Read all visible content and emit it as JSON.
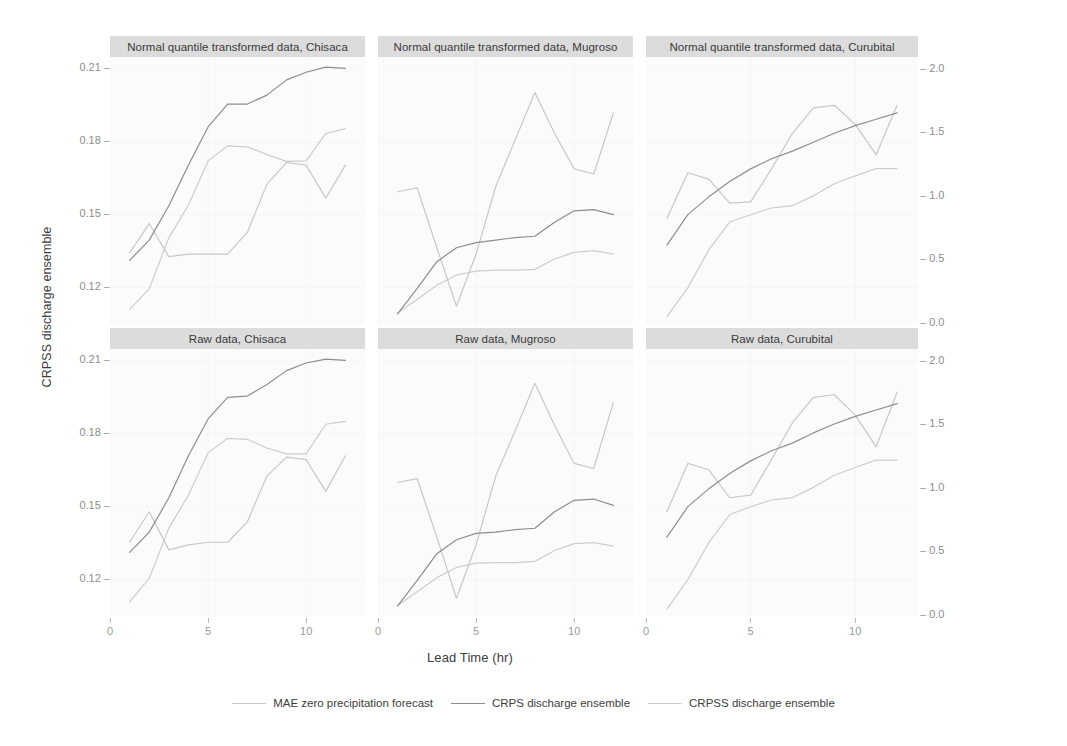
{
  "axes": {
    "y_left_title": "CRPSS discharge ensemble",
    "y_right_title": "MAE zero forecast precipitation and CRPS discharge ensemble",
    "x_title": "Lead Time (hr)",
    "y_left_ticks": [
      "0.21",
      "0.18",
      "0.15",
      "0.12"
    ],
    "y_right_ticks": [
      "2.0",
      "1.5",
      "1.0",
      "0.5",
      "0.0"
    ],
    "x_ticks": [
      "0",
      "5",
      "10"
    ]
  },
  "legend": {
    "items": [
      {
        "label": "MAE zero precipitation forecast",
        "color": "#c8c8c8"
      },
      {
        "label": "CRPS discharge ensemble",
        "color": "#8e8e8e"
      },
      {
        "label": "CRPSS discharge ensemble",
        "color": "#cdcdcd"
      }
    ]
  },
  "panels": [
    {
      "title": "Normal quantile transformed data, Chisaca"
    },
    {
      "title": "Normal quantile transformed data, Mugroso"
    },
    {
      "title": "Normal quantile transformed data, Curubital"
    },
    {
      "title": "Raw data, Chisaca"
    },
    {
      "title": "Raw data, Mugroso"
    },
    {
      "title": "Raw data, Curubital"
    }
  ],
  "chart_data": {
    "type": "line",
    "title": "",
    "xlabel": "Lead Time (hr)",
    "ylabel": "CRPSS discharge ensemble",
    "ylabel_right": "MAE zero forecast precipitation and CRPS discharge ensemble",
    "xlim": [
      0,
      13
    ],
    "ylim_left": [
      0.105,
      0.215
    ],
    "ylim_right": [
      0.0,
      2.1
    ],
    "grid": true,
    "legend_position": "bottom",
    "facet_rows": [
      "Normal quantile transformed data",
      "Raw data"
    ],
    "facet_cols": [
      "Chisaca",
      "Mugroso",
      "Curubital"
    ],
    "series_names": [
      "MAE zero precipitation forecast",
      "CRPS discharge ensemble",
      "CRPSS discharge ensemble"
    ],
    "panels": [
      {
        "title": "Normal quantile transformed data, Chisaca",
        "row": 0,
        "col": 0,
        "x": [
          1,
          2,
          3,
          4,
          5,
          6,
          7,
          8,
          9,
          10,
          11,
          12
        ],
        "series": [
          {
            "name": "CRPSS discharge ensemble",
            "axis": "left",
            "values": [
              0.111,
              0.1195,
              0.1405,
              0.154,
              0.1722,
              0.1784,
              0.178,
              0.1748,
              0.172,
              0.1722,
              0.1835,
              0.1855
            ]
          },
          {
            "name": "MAE zero precipitation forecast",
            "axis": "right",
            "values": [
              0.56,
              0.79,
              0.53,
              0.55,
              0.55,
              0.55,
              0.72,
              1.1,
              1.27,
              1.25,
              0.99,
              1.25
            ]
          },
          {
            "name": "CRPS discharge ensemble",
            "axis": "right",
            "values": [
              0.5,
              0.66,
              0.93,
              1.25,
              1.55,
              1.73,
              1.73,
              1.8,
              1.92,
              1.98,
              2.02,
              2.01
            ]
          }
        ]
      },
      {
        "title": "Normal quantile transformed data, Mugroso",
        "row": 0,
        "col": 1,
        "x": [
          1,
          2,
          3,
          4,
          5,
          6,
          7,
          8,
          9,
          10,
          11,
          12
        ],
        "series": [
          {
            "name": "CRPSS discharge ensemble",
            "axis": "left",
            "values": [
              0.1095,
              0.1152,
              0.121,
              0.1252,
              0.1268,
              0.1272,
              0.1272,
              0.1275,
              0.1318,
              0.1345,
              0.1352,
              0.1338
            ]
          },
          {
            "name": "MAE zero precipitation forecast",
            "axis": "right",
            "values": [
              1.04,
              1.07,
              0.6,
              0.14,
              0.55,
              1.08,
              1.45,
              1.82,
              1.5,
              1.22,
              1.18,
              1.66
            ]
          },
          {
            "name": "CRPS discharge ensemble",
            "axis": "right",
            "values": [
              0.08,
              0.28,
              0.49,
              0.6,
              0.64,
              0.66,
              0.68,
              0.69,
              0.8,
              0.89,
              0.9,
              0.86
            ]
          }
        ]
      },
      {
        "title": "Normal quantile transformed data, Curubital",
        "row": 0,
        "col": 2,
        "x": [
          1,
          2,
          3,
          4,
          5,
          6,
          7,
          8,
          9,
          10,
          11,
          12
        ],
        "series": [
          {
            "name": "CRPSS discharge ensemble",
            "axis": "left",
            "values": [
              0.108,
              0.12,
              0.1355,
              0.147,
              0.15,
              0.1528,
              0.1538,
              0.1578,
              0.1628,
              0.166,
              0.169,
              0.169
            ]
          },
          {
            "name": "MAE zero precipitation forecast",
            "axis": "right",
            "values": [
              0.83,
              1.19,
              1.14,
              0.95,
              0.96,
              1.22,
              1.5,
              1.7,
              1.72,
              1.57,
              1.33,
              1.72
            ]
          },
          {
            "name": "CRPS discharge ensemble",
            "axis": "right",
            "values": [
              0.62,
              0.86,
              1.0,
              1.12,
              1.22,
              1.3,
              1.36,
              1.43,
              1.5,
              1.56,
              1.61,
              1.66
            ]
          }
        ]
      },
      {
        "title": "Raw data, Chisaca",
        "row": 1,
        "col": 0,
        "x": [
          1,
          2,
          3,
          4,
          5,
          6,
          7,
          8,
          9,
          10,
          11,
          12
        ],
        "series": [
          {
            "name": "CRPSS discharge ensemble",
            "axis": "left",
            "values": [
              0.1108,
              0.1205,
              0.1412,
              0.1548,
              0.1722,
              0.1782,
              0.1778,
              0.1742,
              0.1718,
              0.1718,
              0.184,
              0.1852
            ]
          },
          {
            "name": "MAE zero precipitation forecast",
            "axis": "right",
            "values": [
              0.58,
              0.82,
              0.52,
              0.56,
              0.58,
              0.58,
              0.74,
              1.1,
              1.25,
              1.23,
              0.98,
              1.26
            ]
          },
          {
            "name": "CRPS discharge ensemble",
            "axis": "right",
            "values": [
              0.5,
              0.66,
              0.93,
              1.26,
              1.55,
              1.72,
              1.73,
              1.82,
              1.93,
              1.99,
              2.02,
              2.01
            ]
          }
        ]
      },
      {
        "title": "Raw data, Mugroso",
        "row": 1,
        "col": 1,
        "x": [
          1,
          2,
          3,
          4,
          5,
          6,
          7,
          8,
          9,
          10,
          11,
          12
        ],
        "series": [
          {
            "name": "CRPSS discharge ensemble",
            "axis": "left",
            "values": [
              0.1092,
              0.115,
              0.1208,
              0.125,
              0.1268,
              0.127,
              0.127,
              0.1275,
              0.132,
              0.1348,
              0.1352,
              0.1338
            ]
          },
          {
            "name": "MAE zero precipitation forecast",
            "axis": "right",
            "values": [
              1.05,
              1.08,
              0.62,
              0.14,
              0.56,
              1.1,
              1.46,
              1.83,
              1.5,
              1.2,
              1.16,
              1.68
            ]
          },
          {
            "name": "CRPS discharge ensemble",
            "axis": "right",
            "values": [
              0.08,
              0.28,
              0.49,
              0.6,
              0.65,
              0.66,
              0.68,
              0.69,
              0.82,
              0.91,
              0.92,
              0.87
            ]
          }
        ]
      },
      {
        "title": "Raw data, Curubital",
        "row": 1,
        "col": 2,
        "x": [
          1,
          2,
          3,
          4,
          5,
          6,
          7,
          8,
          9,
          10,
          11,
          12
        ],
        "series": [
          {
            "name": "CRPSS discharge ensemble",
            "axis": "left",
            "values": [
              0.1078,
              0.12,
              0.1352,
              0.1468,
              0.15,
              0.1528,
              0.1538,
              0.158,
              0.163,
              0.1662,
              0.1692,
              0.1692
            ]
          },
          {
            "name": "MAE zero precipitation forecast",
            "axis": "right",
            "values": [
              0.82,
              1.2,
              1.15,
              0.93,
              0.95,
              1.23,
              1.52,
              1.72,
              1.74,
              1.58,
              1.33,
              1.76
            ]
          },
          {
            "name": "CRPS discharge ensemble",
            "axis": "right",
            "values": [
              0.62,
              0.86,
              1.0,
              1.12,
              1.22,
              1.3,
              1.36,
              1.44,
              1.51,
              1.57,
              1.62,
              1.67
            ]
          }
        ]
      }
    ]
  }
}
